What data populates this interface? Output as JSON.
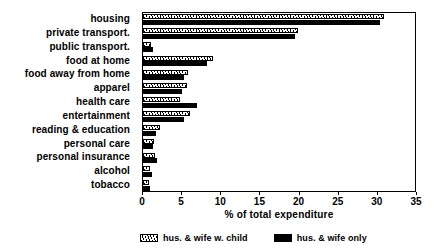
{
  "chart_data": {
    "type": "bar",
    "orientation": "horizontal",
    "title": "",
    "xlabel": "% of total expenditure",
    "ylabel": "",
    "xlim": [
      0,
      35
    ],
    "xticks": [
      0,
      5,
      10,
      15,
      20,
      25,
      30,
      35
    ],
    "grid": false,
    "legend_position": "bottom",
    "categories": [
      "housing",
      "private transport.",
      "public transport.",
      "food at home",
      "food away from home",
      "apparel",
      "health care",
      "entertainment",
      "reading & education",
      "personal care",
      "personal insurance",
      "alcohol",
      "tobacco"
    ],
    "series": [
      {
        "name": "hus. & wife w. child",
        "fill": "hatched",
        "values": [
          31.0,
          20.0,
          1.0,
          9.0,
          5.8,
          5.6,
          4.8,
          6.0,
          2.2,
          1.4,
          1.6,
          0.9,
          0.8
        ]
      },
      {
        "name": "hus. & wife only",
        "fill": "solid",
        "values": [
          30.5,
          19.5,
          1.3,
          8.2,
          5.3,
          5.0,
          7.0,
          5.3,
          1.7,
          1.3,
          1.8,
          1.1,
          0.9
        ]
      }
    ]
  },
  "legend": {
    "entries": [
      {
        "label": "hus. & wife w. child",
        "fill": "hatched"
      },
      {
        "label": "hus. & wife only",
        "fill": "solid"
      }
    ]
  }
}
